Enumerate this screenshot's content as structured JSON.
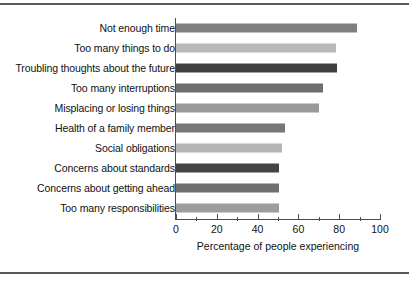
{
  "chart_data": {
    "type": "bar",
    "orientation": "horizontal",
    "title": "",
    "xlabel": "Percentage of people experiencing",
    "ylabel": "",
    "xlim": [
      0,
      100
    ],
    "xticks": [
      0,
      20,
      40,
      60,
      80,
      100
    ],
    "xtick_labels": [
      "0",
      "20",
      "40",
      "60",
      "80",
      "100"
    ],
    "minor_xticks": [
      10,
      30,
      50,
      70,
      90
    ],
    "grid": false,
    "legend": null,
    "categories": [
      "Not enough time",
      "Too many things to do",
      "Troubling thoughts about the future",
      "Too many interruptions",
      "Misplacing or losing things",
      "Health of a family member",
      "Social obligations",
      "Concerns about standards",
      "Concerns about getting ahead",
      "Too many responsibilities"
    ],
    "values": [
      88.5,
      78.5,
      79,
      72,
      70,
      53.5,
      52,
      50.5,
      50.5,
      50.5
    ],
    "bar_colors": [
      "#808080",
      "#b9b9b9",
      "#404040",
      "#6e6e6e",
      "#9a9a9a",
      "#777777",
      "#b4b4b4",
      "#444444",
      "#6f6f6f",
      "#9c9c9c"
    ]
  },
  "figure": {
    "frame_color": "#595959",
    "axis_color": "#4d4d4d",
    "background": "#ffffff"
  }
}
